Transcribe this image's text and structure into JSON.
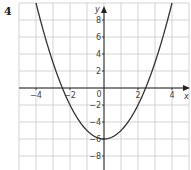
{
  "question_number": "4",
  "chart_data": {
    "type": "line",
    "title": "",
    "function": "y = x^2 - 6",
    "xlabel": "x",
    "ylabel": "y",
    "xlim": [
      -5,
      5.5
    ],
    "ylim": [
      -10,
      10.2
    ],
    "x_ticks": [
      -4,
      -2,
      0,
      2,
      4
    ],
    "x_tick_labels": [
      "-4",
      "-2",
      "0",
      "2",
      "4"
    ],
    "y_ticks": [
      8,
      6,
      4,
      2,
      -2,
      -4,
      -6,
      -8
    ],
    "y_tick_labels": [
      "8",
      "6",
      "4",
      "2",
      "-2",
      "-4",
      "-6",
      "-8"
    ],
    "origin_label": "0",
    "grid": true,
    "grid_x_step": 1,
    "grid_y_step": 2,
    "series": [
      {
        "name": "parabola",
        "x": [
          -4,
          -3,
          -2.45,
          -2,
          -1,
          0,
          1,
          2,
          2.45,
          3,
          4
        ],
        "y": [
          10,
          3,
          0,
          -2,
          -5,
          -6,
          -5,
          -2,
          0,
          3,
          10
        ]
      }
    ],
    "vertex": [
      0,
      -6
    ],
    "roots": [
      -2.45,
      2.45
    ],
    "colors": {
      "curve": "#333333",
      "grid": "#c8c8c8",
      "axis": "#222222"
    }
  }
}
